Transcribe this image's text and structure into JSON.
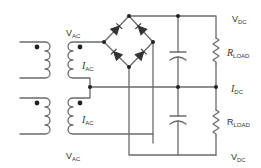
{
  "diagram": {
    "type": "circuit",
    "colors": {
      "wire": "#6b6b6b",
      "text": "#333333",
      "background": "#ffffff"
    },
    "labels": {
      "vac_top": {
        "main": "V",
        "sub": "AC"
      },
      "iac_top": {
        "main": "I",
        "sub": "AC"
      },
      "iac_bottom": {
        "main": "I",
        "sub": "AC"
      },
      "vac_bottom": {
        "main": "V",
        "sub": "AC"
      },
      "vdc_top": {
        "main": "V",
        "sub": "DC"
      },
      "rload_top": {
        "main": "R",
        "sub": "LOAD"
      },
      "idc": {
        "main": "I",
        "sub": "DC"
      },
      "rload_bottom": {
        "main": "R",
        "sub": "LOAD"
      },
      "vdc_bottom": {
        "main": "V",
        "sub": "DC"
      }
    },
    "components": [
      "transformer-top",
      "transformer-bottom",
      "diode-bridge (4 diodes)",
      "capacitor-top",
      "capacitor-bottom",
      "resistor-load-top",
      "resistor-load-bottom"
    ]
  }
}
